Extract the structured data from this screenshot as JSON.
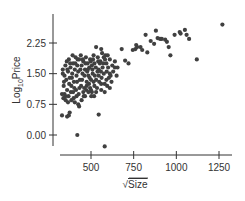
{
  "chart_data": {
    "type": "scatter",
    "title": "",
    "xlabel": "√Size",
    "ylabel": "Log10Price",
    "ylabel_main": "Log",
    "ylabel_sub": "10",
    "ylabel_tail": "Price",
    "xlabel_radical": "√",
    "xlabel_text": "Size",
    "xlim": [
      280,
      1290
    ],
    "ylim": [
      -0.35,
      2.65
    ],
    "xticks": [
      500,
      750,
      1000,
      1250
    ],
    "xtick_labels": [
      "500",
      "750",
      "1000",
      "1250"
    ],
    "yticks": [
      0.0,
      0.75,
      1.5,
      2.25
    ],
    "ytick_labels": [
      "0.00",
      "0.75",
      "1.50",
      "2.25"
    ],
    "grid": false,
    "legend": null,
    "point_color": "#404040",
    "points": [
      [
        1270,
        2.7
      ],
      [
        1050,
        2.57
      ],
      [
        1020,
        2.52
      ],
      [
        1025,
        2.48
      ],
      [
        990,
        2.45
      ],
      [
        1060,
        2.45
      ],
      [
        1075,
        2.35
      ],
      [
        1120,
        1.85
      ],
      [
        880,
        2.55
      ],
      [
        890,
        2.37
      ],
      [
        905,
        2.35
      ],
      [
        915,
        2.35
      ],
      [
        935,
        2.33
      ],
      [
        945,
        2.28
      ],
      [
        955,
        2.15
      ],
      [
        965,
        1.95
      ],
      [
        820,
        2.45
      ],
      [
        850,
        2.3
      ],
      [
        870,
        2.23
      ],
      [
        800,
        2.08
      ],
      [
        830,
        2.02
      ],
      [
        760,
        2.1
      ],
      [
        770,
        2.15
      ],
      [
        790,
        2.15
      ],
      [
        745,
        2.08
      ],
      [
        700,
        1.82
      ],
      [
        720,
        1.75
      ],
      [
        765,
        2.2
      ],
      [
        680,
        2.1
      ],
      [
        640,
        1.65
      ],
      [
        630,
        1.55
      ],
      [
        650,
        1.45
      ],
      [
        615,
        1.45
      ],
      [
        600,
        1.65
      ],
      [
        610,
        1.85
      ],
      [
        620,
        1.3
      ],
      [
        590,
        1.75
      ],
      [
        585,
        1.95
      ],
      [
        575,
        1.9
      ],
      [
        560,
        2.1
      ],
      [
        565,
        2.0
      ],
      [
        555,
        1.8
      ],
      [
        545,
        1.6
      ],
      [
        575,
        1.5
      ],
      [
        595,
        1.2
      ],
      [
        540,
        1.9
      ],
      [
        530,
        2.15
      ],
      [
        520,
        1.75
      ],
      [
        515,
        1.95
      ],
      [
        505,
        1.7
      ],
      [
        510,
        1.5
      ],
      [
        500,
        1.35
      ],
      [
        520,
        1.2
      ],
      [
        505,
        1.05
      ],
      [
        495,
        1.85
      ],
      [
        490,
        1.65
      ],
      [
        485,
        1.45
      ],
      [
        480,
        1.75
      ],
      [
        470,
        1.9
      ],
      [
        465,
        1.6
      ],
      [
        475,
        1.3
      ],
      [
        455,
        1.8
      ],
      [
        450,
        1.5
      ],
      [
        445,
        1.7
      ],
      [
        460,
        1.15
      ],
      [
        440,
        1.95
      ],
      [
        430,
        1.85
      ],
      [
        425,
        1.55
      ],
      [
        435,
        1.35
      ],
      [
        420,
        1.7
      ],
      [
        415,
        1.45
      ],
      [
        410,
        1.9
      ],
      [
        405,
        1.6
      ],
      [
        400,
        1.3
      ],
      [
        395,
        1.75
      ],
      [
        390,
        1.5
      ],
      [
        385,
        1.2
      ],
      [
        380,
        1.65
      ],
      [
        375,
        1.4
      ],
      [
        370,
        1.85
      ],
      [
        365,
        1.55
      ],
      [
        360,
        1.1
      ],
      [
        355,
        1.35
      ],
      [
        350,
        1.7
      ],
      [
        345,
        1.45
      ],
      [
        340,
        1.2
      ],
      [
        335,
        1.6
      ],
      [
        330,
        1.0
      ],
      [
        338,
        0.9
      ],
      [
        352,
        0.85
      ],
      [
        368,
        0.95
      ],
      [
        382,
        1.05
      ],
      [
        398,
        0.9
      ],
      [
        412,
        1.1
      ],
      [
        428,
        1.0
      ],
      [
        442,
        1.2
      ],
      [
        458,
        0.95
      ],
      [
        472,
        1.1
      ],
      [
        488,
        1.25
      ],
      [
        502,
        0.95
      ],
      [
        518,
        0.95
      ],
      [
        535,
        1.15
      ],
      [
        548,
        1.3
      ],
      [
        562,
        1.4
      ],
      [
        580,
        1.25
      ],
      [
        592,
        1.55
      ],
      [
        605,
        1.4
      ],
      [
        358,
        1.8
      ],
      [
        372,
        1.25
      ],
      [
        388,
        1.4
      ],
      [
        402,
        1.15
      ],
      [
        418,
        1.3
      ],
      [
        432,
        1.15
      ],
      [
        448,
        1.35
      ],
      [
        462,
        1.45
      ],
      [
        478,
        1.55
      ],
      [
        492,
        1.4
      ],
      [
        508,
        1.6
      ],
      [
        522,
        1.45
      ],
      [
        538,
        1.55
      ],
      [
        552,
        1.75
      ],
      [
        568,
        1.65
      ],
      [
        582,
        1.85
      ],
      [
        342,
        1.3
      ],
      [
        362,
        1.6
      ],
      [
        378,
        1.75
      ],
      [
        392,
        1.95
      ],
      [
        408,
        1.75
      ],
      [
        422,
        1.85
      ],
      [
        438,
        1.6
      ],
      [
        452,
        1.85
      ],
      [
        468,
        1.75
      ],
      [
        482,
        1.6
      ],
      [
        498,
        1.8
      ],
      [
        512,
        1.85
      ],
      [
        528,
        1.65
      ],
      [
        542,
        1.8
      ],
      [
        558,
        1.55
      ],
      [
        572,
        1.75
      ],
      [
        598,
        1.95
      ],
      [
        345,
        1.0
      ],
      [
        365,
        0.8
      ],
      [
        385,
        0.85
      ],
      [
        405,
        0.8
      ],
      [
        425,
        0.75
      ],
      [
        445,
        0.85
      ],
      [
        465,
        0.95
      ],
      [
        485,
        1.05
      ],
      [
        335,
        1.5
      ],
      [
        350,
        0.95
      ],
      [
        395,
        1.05
      ],
      [
        415,
        0.95
      ],
      [
        455,
        1.05
      ],
      [
        475,
        1.2
      ],
      [
        495,
        1.15
      ],
      [
        515,
        1.3
      ],
      [
        530,
        1.35
      ],
      [
        545,
        1.45
      ],
      [
        560,
        1.25
      ],
      [
        590,
        1.35
      ],
      [
        610,
        1.5
      ],
      [
        625,
        1.7
      ],
      [
        640,
        1.8
      ],
      [
        655,
        1.65
      ],
      [
        500,
        1.1
      ],
      [
        530,
        1.05
      ],
      [
        560,
        1.1
      ],
      [
        580,
        1.05
      ],
      [
        610,
        1.15
      ],
      [
        330,
        0.48
      ],
      [
        360,
        0.45
      ],
      [
        370,
        0.48
      ],
      [
        375,
        0.55
      ],
      [
        430,
        0.7
      ],
      [
        545,
        0.5
      ],
      [
        420,
        0.0
      ],
      [
        580,
        -0.28
      ]
    ]
  }
}
